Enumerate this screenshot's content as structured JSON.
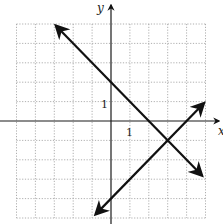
{
  "chart_data": {
    "type": "line",
    "title": "",
    "xlabel": "x",
    "ylabel": "y",
    "xlim": [
      -5,
      5
    ],
    "ylim": [
      -5,
      5
    ],
    "grid": true,
    "grid_style": "dotted",
    "tick_labels": {
      "x": [
        "1"
      ],
      "y": [
        "1"
      ]
    },
    "series": [
      {
        "name": "line-decreasing",
        "equation": "y = -x + 2",
        "slope": -1,
        "y_intercept": 2,
        "x": [
          -2.9,
          4.8
        ],
        "y": [
          4.9,
          -2.8
        ],
        "arrows": "both"
      },
      {
        "name": "line-increasing",
        "equation": "y = x - 4",
        "slope": 1,
        "y_intercept": -4,
        "x": [
          -0.8,
          4.9
        ],
        "y": [
          -4.8,
          0.9
        ],
        "arrows": "both"
      }
    ],
    "intersection": {
      "x": 3,
      "y": -1
    }
  },
  "labels": {
    "x_axis": "x",
    "y_axis": "y",
    "x_tick": "1",
    "y_tick": "1"
  },
  "colors": {
    "axis": "#1a1a1a",
    "grid": "#9a9a9a",
    "line": "#111111"
  }
}
